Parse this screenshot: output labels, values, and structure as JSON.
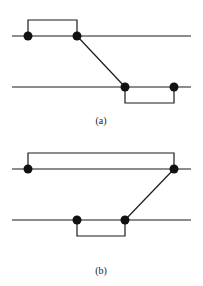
{
  "panels": [
    {
      "label": "(a)",
      "description": "Two horizontal lines; top line has two nodes joined by an upper bracket, bottom line has two nodes joined by a lower bracket; a diagonal connects the right node of the top line to the left node of the bottom line."
    },
    {
      "label": "(b)",
      "description": "Two horizontal lines; top line has two widely spaced nodes joined by an upper bracket, bottom line has two nodes joined by a lower bracket; a diagonal connects the right node of the bottom line to the right node of the top line."
    }
  ],
  "colors": {
    "line": "#1a1a1a",
    "node": "#111111",
    "background": "#ffffff"
  }
}
